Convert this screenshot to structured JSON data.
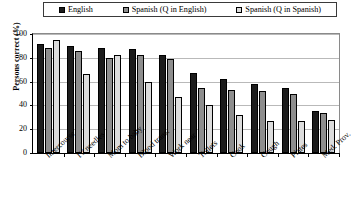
{
  "legend": {
    "position": "top",
    "entries": [
      {
        "label": "English",
        "swatch_name": "legend-swatch-english",
        "color": "#1c1c1c"
      },
      {
        "label": "Spanish (Q in English)",
        "swatch_name": "legend-swatch-spanish-q-english",
        "color": "#8e8e8e"
      },
      {
        "label": "Spanish (Q in Spanish)",
        "swatch_name": "legend-swatch-spanish-q-spanish",
        "color": "#dcdcdc"
      }
    ]
  },
  "axes": {
    "ylabel": "Persons correct (%)",
    "xlabel": "",
    "yticks": [
      "100",
      "80",
      "60",
      "40",
      "20",
      "0"
    ],
    "ytick_values": [
      100,
      80,
      60,
      40,
      20,
      0
    ],
    "ylim": [
      0,
      100
    ],
    "grid": true
  },
  "chart_data": {
    "type": "bar",
    "title": "",
    "xlabel": "",
    "ylabel": "Persons correct (%)",
    "ylim": [
      0,
      100
    ],
    "grid": true,
    "legend_position": "top",
    "categories": [
      "Intercourse",
      "IV needles",
      "Mom to baby",
      "Blood trans.",
      "Work near",
      "Toilets",
      "Cook",
      "Cough",
      "Plates",
      "Med. Prov."
    ],
    "series": [
      {
        "name": "English",
        "color": "#1c1c1c",
        "values": [
          92,
          90,
          88,
          87,
          82,
          67,
          62,
          58,
          55,
          35
        ]
      },
      {
        "name": "Spanish (Q in English)",
        "color": "#8e8e8e",
        "values": [
          88,
          86,
          80,
          82,
          79,
          55,
          53,
          52,
          50,
          34
        ]
      },
      {
        "name": "Spanish (Q in Spanish)",
        "color": "#dcdcdc",
        "values": [
          95,
          66,
          82,
          60,
          47,
          40,
          32,
          27,
          27,
          28
        ]
      }
    ]
  }
}
